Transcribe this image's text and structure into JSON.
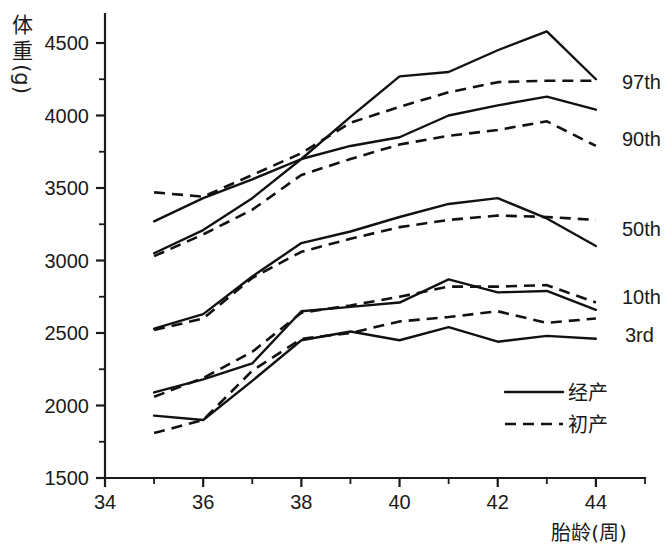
{
  "chart_data": {
    "type": "line",
    "title": "",
    "xlabel": "胎龄(周)",
    "ylabel": "体重(g)",
    "ylabel_chars": [
      "体",
      "重",
      "(g)"
    ],
    "xlim": [
      34,
      45
    ],
    "ylim": [
      1500,
      4700
    ],
    "x_ticks": [
      34,
      36,
      38,
      40,
      42,
      44
    ],
    "x_tick_labels": [
      "34",
      "36",
      "38",
      "40",
      "42",
      "44"
    ],
    "x_minor_ticks": [
      35,
      37,
      39,
      41,
      43,
      45
    ],
    "y_ticks": [
      1500,
      2000,
      2500,
      3000,
      3500,
      4000,
      4500
    ],
    "y_tick_labels": [
      "1500",
      "2000",
      "2500",
      "3000",
      "3500",
      "4000",
      "4500"
    ],
    "y_minor_ticks": [
      1750,
      2250,
      2750,
      3250,
      3750,
      4250,
      4750
    ],
    "grid": false,
    "legend_position": "lower-right",
    "legend": [
      {
        "name": "经产",
        "style": "solid"
      },
      {
        "name": "初产",
        "style": "dashed"
      }
    ],
    "percentile_labels": [
      "97th",
      "90th",
      "50th",
      "10th",
      "3rd"
    ],
    "x": [
      35,
      36,
      37,
      38,
      39,
      40,
      41,
      42,
      43,
      44
    ],
    "series": [
      {
        "name": "97th 经产",
        "percentile": "97th",
        "parity": "经产",
        "style": "solid",
        "values": [
          3270,
          3430,
          3560,
          3700,
          3990,
          4270,
          4300,
          4450,
          4580,
          4250
        ]
      },
      {
        "name": "97th 初产",
        "percentile": "97th",
        "parity": "初产",
        "style": "dashed",
        "values": [
          3470,
          3440,
          3590,
          3740,
          3950,
          4060,
          4160,
          4230,
          4240,
          4240
        ]
      },
      {
        "name": "90th 经产",
        "percentile": "90th",
        "parity": "经产",
        "style": "solid",
        "values": [
          3050,
          3210,
          3430,
          3700,
          3790,
          3850,
          4000,
          4070,
          4130,
          4040
        ]
      },
      {
        "name": "90th 初产",
        "percentile": "90th",
        "parity": "初产",
        "style": "dashed",
        "values": [
          3030,
          3180,
          3350,
          3590,
          3700,
          3800,
          3860,
          3900,
          3960,
          3790
        ]
      },
      {
        "name": "50th 经产",
        "percentile": "50th",
        "parity": "经产",
        "style": "solid",
        "values": [
          2530,
          2630,
          2890,
          3120,
          3200,
          3300,
          3390,
          3430,
          3290,
          3100
        ]
      },
      {
        "name": "50th 初产",
        "percentile": "50th",
        "parity": "初产",
        "style": "dashed",
        "values": [
          2520,
          2600,
          2880,
          3060,
          3150,
          3230,
          3280,
          3310,
          3300,
          3280
        ]
      },
      {
        "name": "10th 经产",
        "percentile": "10th",
        "parity": "经产",
        "style": "solid",
        "values": [
          2090,
          2180,
          2290,
          2650,
          2680,
          2710,
          2870,
          2780,
          2790,
          2660
        ]
      },
      {
        "name": "10th 初产",
        "percentile": "10th",
        "parity": "初产",
        "style": "dashed",
        "values": [
          2060,
          2190,
          2370,
          2640,
          2690,
          2750,
          2820,
          2820,
          2830,
          2710
        ]
      },
      {
        "name": "3rd 经产",
        "percentile": "3rd",
        "parity": "经产",
        "style": "solid",
        "values": [
          1930,
          1900,
          2170,
          2450,
          2510,
          2450,
          2540,
          2440,
          2480,
          2460
        ]
      },
      {
        "name": "3rd 初产",
        "percentile": "3rd",
        "parity": "初产",
        "style": "dashed",
        "values": [
          1810,
          1900,
          2240,
          2460,
          2500,
          2580,
          2610,
          2650,
          2570,
          2600
        ]
      }
    ]
  }
}
